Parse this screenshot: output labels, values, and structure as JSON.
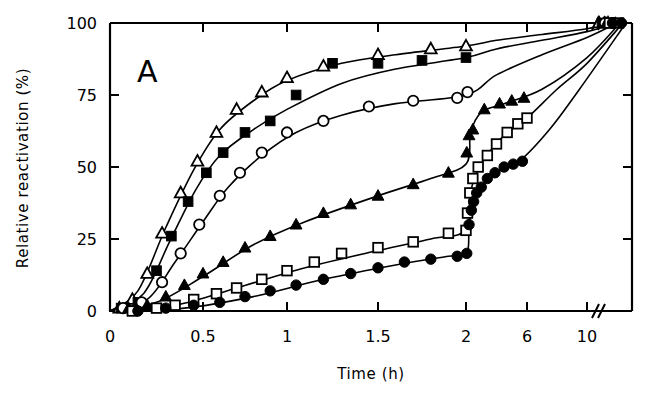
{
  "figure": {
    "panel_label": "A",
    "background_color": "#ffffff",
    "ink_color": "#000000"
  },
  "chart_data": {
    "type": "scatter",
    "title": "",
    "subtitle": "",
    "panel": "A",
    "xlabel": "Time   (h)",
    "ylabel": "Relative reactivation   (%)",
    "xlim": [
      0,
      13
    ],
    "ylim": [
      0,
      100
    ],
    "grid": false,
    "legend": "none",
    "axis_break": {
      "present": true,
      "after_tick": "10",
      "note": "x-axis compresses between 2 and 10 h, with a break mark drawn just after the 10 h tick on both the bottom and top axis spines"
    },
    "xticks": [
      {
        "label": "0",
        "value": 0
      },
      {
        "label": "0.5",
        "value": 0.5
      },
      {
        "label": "1",
        "value": 1
      },
      {
        "label": "1.5",
        "value": 1.5
      },
      {
        "label": "2",
        "value": 2
      },
      {
        "label": "6",
        "value": 6
      },
      {
        "label": "10",
        "value": 10
      }
    ],
    "yticks": [
      {
        "label": "0",
        "value": 0
      },
      {
        "label": "25",
        "value": 25
      },
      {
        "label": "50",
        "value": 50
      },
      {
        "label": "75",
        "value": 75
      },
      {
        "label": "100",
        "value": 100
      }
    ],
    "series": [
      {
        "name": "series-open-triangle",
        "marker": "open-triangle",
        "filled": false,
        "points": [
          [
            0.05,
            1
          ],
          [
            0.12,
            4
          ],
          [
            0.2,
            13
          ],
          [
            0.28,
            27
          ],
          [
            0.38,
            41
          ],
          [
            0.47,
            52
          ],
          [
            0.58,
            62
          ],
          [
            0.7,
            70
          ],
          [
            0.85,
            76
          ],
          [
            1.0,
            81
          ],
          [
            1.2,
            85
          ],
          [
            1.5,
            89
          ],
          [
            1.8,
            91
          ],
          [
            2.0,
            92
          ],
          [
            10.8,
            100
          ],
          [
            11.4,
            100
          ]
        ],
        "curve": [
          [
            0.0,
            0
          ],
          [
            0.15,
            7
          ],
          [
            0.3,
            29
          ],
          [
            0.45,
            49
          ],
          [
            0.6,
            63
          ],
          [
            0.8,
            73
          ],
          [
            1.0,
            80
          ],
          [
            1.3,
            86
          ],
          [
            1.6,
            89
          ],
          [
            2.0,
            92
          ],
          [
            4.0,
            94
          ],
          [
            7.0,
            96
          ],
          [
            10.0,
            98
          ],
          [
            11.6,
            100
          ]
        ]
      },
      {
        "name": "series-filled-square",
        "marker": "filled-square",
        "filled": true,
        "points": [
          [
            0.06,
            1
          ],
          [
            0.15,
            3
          ],
          [
            0.25,
            14
          ],
          [
            0.33,
            26
          ],
          [
            0.42,
            38
          ],
          [
            0.52,
            48
          ],
          [
            0.62,
            55
          ],
          [
            0.75,
            62
          ],
          [
            0.9,
            66
          ],
          [
            1.05,
            75
          ],
          [
            1.25,
            86
          ],
          [
            1.5,
            86
          ],
          [
            1.75,
            87
          ],
          [
            2.0,
            88
          ],
          [
            11.0,
            100
          ],
          [
            11.5,
            100
          ]
        ],
        "curve": [
          [
            0.0,
            0
          ],
          [
            0.18,
            6
          ],
          [
            0.32,
            24
          ],
          [
            0.46,
            42
          ],
          [
            0.6,
            54
          ],
          [
            0.8,
            63
          ],
          [
            1.0,
            70
          ],
          [
            1.3,
            79
          ],
          [
            1.6,
            84
          ],
          [
            2.0,
            88
          ],
          [
            4.0,
            91
          ],
          [
            7.0,
            94
          ],
          [
            10.0,
            97
          ],
          [
            11.8,
            100
          ]
        ]
      },
      {
        "name": "series-open-circle",
        "marker": "open-circle",
        "filled": false,
        "points": [
          [
            0.07,
            1
          ],
          [
            0.17,
            3
          ],
          [
            0.28,
            10
          ],
          [
            0.38,
            20
          ],
          [
            0.48,
            30
          ],
          [
            0.6,
            40
          ],
          [
            0.72,
            48
          ],
          [
            0.85,
            55
          ],
          [
            1.0,
            62
          ],
          [
            1.2,
            66
          ],
          [
            1.45,
            71
          ],
          [
            1.7,
            73
          ],
          [
            1.95,
            74
          ],
          [
            2.1,
            76
          ],
          [
            11.2,
            100
          ],
          [
            11.7,
            100
          ]
        ],
        "curve": [
          [
            0.0,
            0
          ],
          [
            0.2,
            4
          ],
          [
            0.35,
            17
          ],
          [
            0.5,
            31
          ],
          [
            0.65,
            43
          ],
          [
            0.85,
            54
          ],
          [
            1.05,
            62
          ],
          [
            1.3,
            68
          ],
          [
            1.6,
            72
          ],
          [
            2.0,
            75
          ],
          [
            4.0,
            82
          ],
          [
            7.0,
            89
          ],
          [
            10.0,
            95
          ],
          [
            12.0,
            100
          ]
        ]
      },
      {
        "name": "series-filled-triangle",
        "marker": "filled-triangle",
        "filled": true,
        "points": [
          [
            0.1,
            1
          ],
          [
            0.2,
            2
          ],
          [
            0.3,
            5
          ],
          [
            0.4,
            9
          ],
          [
            0.5,
            13
          ],
          [
            0.62,
            17
          ],
          [
            0.75,
            22
          ],
          [
            0.9,
            26
          ],
          [
            1.05,
            30
          ],
          [
            1.2,
            34
          ],
          [
            1.35,
            37
          ],
          [
            1.5,
            40
          ],
          [
            1.7,
            44
          ],
          [
            1.9,
            48
          ],
          [
            2.05,
            55
          ],
          [
            2.2,
            61
          ],
          [
            2.45,
            63
          ],
          [
            3.2,
            70
          ],
          [
            4.2,
            72
          ],
          [
            5.0,
            73
          ],
          [
            5.8,
            74
          ],
          [
            11.3,
            100
          ],
          [
            11.9,
            100
          ]
        ],
        "curve": [
          [
            0.0,
            0
          ],
          [
            0.25,
            3
          ],
          [
            0.5,
            12
          ],
          [
            0.8,
            23
          ],
          [
            1.1,
            31
          ],
          [
            1.5,
            40
          ],
          [
            1.8,
            46
          ],
          [
            2.0,
            51
          ],
          [
            2.3,
            62
          ],
          [
            3.0,
            69
          ],
          [
            4.5,
            72
          ],
          [
            7.0,
            77
          ],
          [
            10.0,
            88
          ],
          [
            12.2,
            100
          ]
        ]
      },
      {
        "name": "series-open-square",
        "marker": "open-square",
        "filled": false,
        "points": [
          [
            0.12,
            0
          ],
          [
            0.25,
            1
          ],
          [
            0.35,
            2
          ],
          [
            0.45,
            4
          ],
          [
            0.58,
            6
          ],
          [
            0.7,
            8
          ],
          [
            0.85,
            11
          ],
          [
            1.0,
            14
          ],
          [
            1.15,
            17
          ],
          [
            1.3,
            20
          ],
          [
            1.5,
            22
          ],
          [
            1.7,
            24
          ],
          [
            1.9,
            27
          ],
          [
            2.0,
            28
          ],
          [
            2.1,
            34
          ],
          [
            2.25,
            41
          ],
          [
            2.45,
            46
          ],
          [
            2.8,
            50
          ],
          [
            3.4,
            54
          ],
          [
            4.0,
            58
          ],
          [
            4.7,
            62
          ],
          [
            5.4,
            65
          ],
          [
            6.0,
            67
          ],
          [
            11.5,
            100
          ],
          [
            12.1,
            100
          ]
        ],
        "curve": [
          [
            0.0,
            0
          ],
          [
            0.35,
            2
          ],
          [
            0.7,
            8
          ],
          [
            1.1,
            15
          ],
          [
            1.5,
            21
          ],
          [
            1.8,
            25
          ],
          [
            2.0,
            28
          ],
          [
            2.25,
            40
          ],
          [
            2.7,
            48
          ],
          [
            3.5,
            55
          ],
          [
            4.5,
            61
          ],
          [
            6.0,
            67
          ],
          [
            8.0,
            77
          ],
          [
            10.0,
            86
          ],
          [
            12.4,
            100
          ]
        ]
      },
      {
        "name": "series-filled-circle",
        "marker": "filled-circle",
        "filled": true,
        "points": [
          [
            0.15,
            0
          ],
          [
            0.3,
            1
          ],
          [
            0.45,
            2
          ],
          [
            0.6,
            3
          ],
          [
            0.75,
            5
          ],
          [
            0.9,
            7
          ],
          [
            1.05,
            9
          ],
          [
            1.2,
            11
          ],
          [
            1.35,
            13
          ],
          [
            1.5,
            15
          ],
          [
            1.65,
            17
          ],
          [
            1.8,
            18
          ],
          [
            1.95,
            19
          ],
          [
            2.05,
            20
          ],
          [
            2.2,
            30
          ],
          [
            2.35,
            35
          ],
          [
            2.5,
            38
          ],
          [
            2.7,
            41
          ],
          [
            3.0,
            43
          ],
          [
            3.4,
            46
          ],
          [
            3.9,
            48
          ],
          [
            4.5,
            50
          ],
          [
            5.1,
            51
          ],
          [
            5.7,
            52
          ],
          [
            11.7,
            100
          ],
          [
            12.3,
            100
          ]
        ],
        "curve": [
          [
            0.0,
            0
          ],
          [
            0.4,
            1
          ],
          [
            0.8,
            5
          ],
          [
            1.2,
            11
          ],
          [
            1.6,
            16
          ],
          [
            1.9,
            19
          ],
          [
            2.05,
            20
          ],
          [
            2.2,
            30
          ],
          [
            2.5,
            38
          ],
          [
            3.0,
            43
          ],
          [
            4.0,
            48
          ],
          [
            5.5,
            52
          ],
          [
            7.5,
            63
          ],
          [
            9.5,
            77
          ],
          [
            12.6,
            100
          ]
        ]
      }
    ]
  }
}
